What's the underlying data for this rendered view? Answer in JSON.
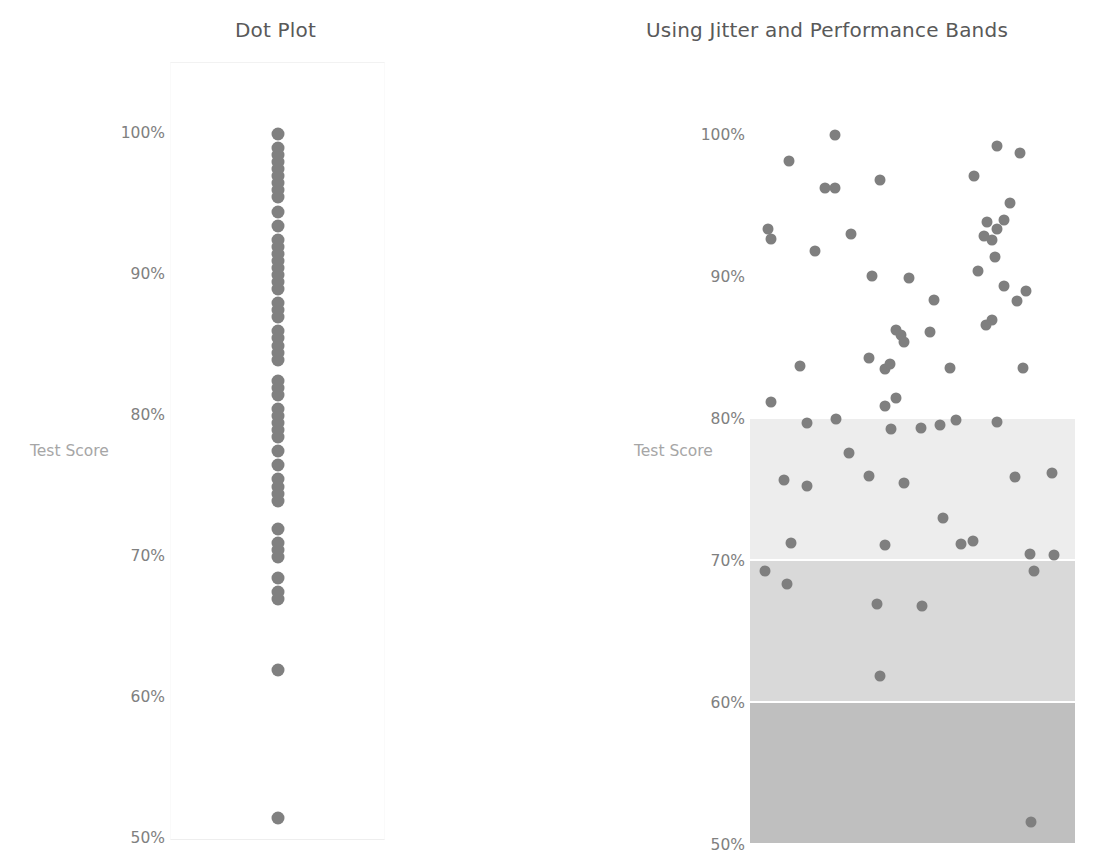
{
  "left": {
    "title": "Dot Plot",
    "axis_title": "Test Score",
    "yticks": [
      "100%",
      "90%",
      "80%",
      "70%",
      "60%",
      "50%"
    ]
  },
  "right": {
    "title": "Using Jitter and Performance Bands",
    "axis_title": "Test Score",
    "yticks": [
      "100%",
      "90%",
      "80%",
      "70%",
      "60%",
      "50%"
    ]
  },
  "colors": {
    "dot": "#808080",
    "tick_text": "#808080",
    "axis_title_text": "#a6a6a6",
    "title_text": "#595959",
    "band_high": "#ededed",
    "band_mid": "#d9d9d9",
    "band_low": "#bfbfbf",
    "background": "#ffffff"
  },
  "chart_data": [
    {
      "id": "dot-plot",
      "type": "scatter",
      "title": "Dot Plot",
      "xlabel": "",
      "ylabel": "Test Score",
      "ylim": [
        50,
        100
      ],
      "yticks": [
        50,
        60,
        70,
        80,
        90,
        100
      ],
      "ytick_labels": [
        "50%",
        "60%",
        "70%",
        "80%",
        "90%",
        "100%"
      ],
      "grid": false,
      "legend": false,
      "jitter": false,
      "note": "All points share a single x position (no jitter); values stack vertically.",
      "x": [
        0,
        0,
        0,
        0,
        0,
        0,
        0,
        0,
        0,
        0,
        0,
        0,
        0,
        0,
        0,
        0,
        0,
        0,
        0,
        0,
        0,
        0,
        0,
        0,
        0,
        0,
        0,
        0,
        0,
        0,
        0,
        0,
        0,
        0,
        0,
        0,
        0,
        0,
        0,
        0,
        0,
        0,
        0,
        0,
        0,
        0,
        0,
        0,
        0,
        0,
        0,
        0,
        0,
        0,
        0,
        0,
        0,
        0,
        0,
        0,
        0,
        0,
        0,
        0,
        0,
        0,
        0,
        0,
        0,
        0,
        0,
        0,
        0,
        0
      ],
      "values": [
        100,
        99,
        98.5,
        98,
        97.5,
        97,
        96.5,
        96,
        95.5,
        94.5,
        93.5,
        92.5,
        92,
        91.5,
        91,
        90.5,
        90,
        89.5,
        89,
        88,
        87.5,
        87,
        86,
        85.5,
        85,
        84.5,
        84,
        82.5,
        82,
        81.5,
        80.5,
        80,
        79.5,
        79,
        78.5,
        77.5,
        76.5,
        75.5,
        75,
        74.5,
        74,
        72,
        71,
        70.5,
        70,
        68.5,
        67.5,
        67,
        62,
        51.5
      ]
    },
    {
      "id": "jitter-bands",
      "type": "scatter",
      "title": "Using Jitter and Performance Bands",
      "xlabel": "",
      "ylabel": "Test Score",
      "ylim": [
        50,
        100
      ],
      "xlim": [
        0,
        1
      ],
      "yticks": [
        50,
        60,
        70,
        80,
        90,
        100
      ],
      "ytick_labels": [
        "50%",
        "60%",
        "70%",
        "80%",
        "90%",
        "100%"
      ],
      "grid": false,
      "legend": false,
      "jitter": true,
      "bands": [
        {
          "name": "high",
          "from": 80,
          "to": 100,
          "color": "#ffffff"
        },
        {
          "name": "upper-mid",
          "from": 70,
          "to": 80,
          "color": "#ededed"
        },
        {
          "name": "lower-mid",
          "from": 60,
          "to": 70,
          "color": "#d9d9d9"
        },
        {
          "name": "low",
          "from": 50,
          "to": 60,
          "color": "#bfbfbf"
        }
      ],
      "points": [
        [
          0.12,
          98.2
        ],
        [
          0.26,
          100.0
        ],
        [
          0.4,
          96.8
        ],
        [
          0.76,
          99.2
        ],
        [
          0.83,
          98.7
        ],
        [
          0.055,
          93.4
        ],
        [
          0.065,
          92.7
        ],
        [
          0.2,
          91.8
        ],
        [
          0.69,
          97.1
        ],
        [
          0.8,
          95.2
        ],
        [
          0.23,
          96.3
        ],
        [
          0.26,
          96.3
        ],
        [
          0.31,
          93.0
        ],
        [
          0.73,
          93.9
        ],
        [
          0.78,
          94.0
        ],
        [
          0.72,
          92.9
        ],
        [
          0.745,
          92.6
        ],
        [
          0.76,
          93.4
        ],
        [
          0.755,
          91.4
        ],
        [
          0.375,
          90.1
        ],
        [
          0.49,
          89.9
        ],
        [
          0.7,
          90.4
        ],
        [
          0.78,
          89.4
        ],
        [
          0.85,
          89.0
        ],
        [
          0.565,
          88.4
        ],
        [
          0.745,
          87.0
        ],
        [
          0.82,
          88.3
        ],
        [
          0.555,
          86.1
        ],
        [
          0.45,
          86.3
        ],
        [
          0.465,
          85.9
        ],
        [
          0.475,
          85.4
        ],
        [
          0.725,
          86.6
        ],
        [
          0.155,
          83.7
        ],
        [
          0.365,
          84.3
        ],
        [
          0.415,
          83.5
        ],
        [
          0.43,
          83.9
        ],
        [
          0.615,
          83.6
        ],
        [
          0.84,
          83.6
        ],
        [
          0.065,
          81.2
        ],
        [
          0.415,
          80.9
        ],
        [
          0.45,
          81.5
        ],
        [
          0.435,
          79.3
        ],
        [
          0.175,
          79.7
        ],
        [
          0.265,
          80.0
        ],
        [
          0.525,
          79.4
        ],
        [
          0.585,
          79.6
        ],
        [
          0.635,
          79.9
        ],
        [
          0.76,
          79.8
        ],
        [
          0.305,
          77.6
        ],
        [
          0.105,
          75.7
        ],
        [
          0.175,
          75.3
        ],
        [
          0.365,
          76.0
        ],
        [
          0.475,
          75.5
        ],
        [
          0.815,
          75.9
        ],
        [
          0.93,
          76.2
        ],
        [
          0.125,
          71.3
        ],
        [
          0.415,
          71.1
        ],
        [
          0.595,
          73.0
        ],
        [
          0.65,
          71.2
        ],
        [
          0.685,
          71.4
        ],
        [
          0.86,
          70.5
        ],
        [
          0.935,
          70.4
        ],
        [
          0.045,
          69.3
        ],
        [
          0.115,
          68.4
        ],
        [
          0.875,
          69.3
        ],
        [
          0.39,
          67.0
        ],
        [
          0.53,
          66.8
        ],
        [
          0.4,
          61.9
        ],
        [
          0.865,
          51.6
        ]
      ]
    }
  ]
}
